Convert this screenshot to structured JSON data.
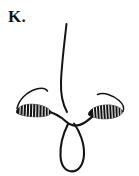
{
  "figure": {
    "plate_label": "K.",
    "domain_type": "diagram",
    "background_color": "#ffffff",
    "ink_color": "#141414",
    "hatch_color": "#ffffff",
    "canvas": {
      "width": 139,
      "height": 176
    },
    "parts": [
      {
        "name": "central-stem",
        "description": "thin slightly curved vertical filament descending from top of plate to the central saddle",
        "stroke_width": 2.0,
        "path": "M 66.5 24 C 64.0 46, 61.5 66, 61.0 82 C 60.6 95, 62.5 104, 67.0 112"
      },
      {
        "name": "central-saddle",
        "description": "rounded connective arch joining left lobe, stem and right lobe",
        "stroke_width": 2.2,
        "path": "M 45.0 110.5 C 54.0 112.5, 60.0 116.0, 66.0 121.5 C 71.5 126.4, 77.5 127.0, 84.0 123.0 C 89.0 120.0, 93.0 116.0, 96.5 113.0"
      },
      {
        "name": "left-lobe",
        "description": "solid black elongated anther lobe with white transverse striations, left side",
        "fill": "#141414",
        "bbox": [
          15,
          104,
          36,
          13
        ],
        "hatch_count": 11,
        "path": "M 16.5 110.5 C 19.5 105.3, 27.0 103.6, 35.0 104.4 C 43.0 105.2, 49.5 108.2, 50.8 111.6 C 51.8 114.4, 47.0 116.6, 38.5 116.8 C 29.0 117.0, 20.0 115.4, 16.5 112.8 Z"
      },
      {
        "name": "left-arc",
        "description": "thin outer arc sweeping up from the left lobe tip toward the stem",
        "stroke_width": 1.5,
        "path": "M 17.0 108.5 C 19.0 99.5, 26.5 92.0, 36.5 89.0 C 42.0 87.4, 45.5 88.2, 47.5 91.0"
      },
      {
        "name": "right-lobe",
        "description": "solid black elongated anther lobe with white transverse striations, right side, tilted",
        "fill": "#141414",
        "bbox": [
          87,
          104,
          36,
          15
        ],
        "hatch_count": 11,
        "path": "M 88.5 113.2 C 90.5 108.6, 97.5 105.6, 105.5 105.0 C 114.0 104.4, 120.8 107.4, 122.3 111.0 C 123.3 113.8, 118.8 117.2, 110.5 118.4 C 101.0 119.8, 92.0 117.4, 88.5 115.0 Z"
      },
      {
        "name": "right-arc",
        "description": "thin outer arc sweeping up and over from the stem side to the right lobe tip",
        "stroke_width": 1.5,
        "path": "M 97.5 94.5 C 104.0 92.0, 112.5 94.8, 119.0 100.5 C 123.0 104.0, 124.5 108.0, 123.0 111.5"
      },
      {
        "name": "pendant-loop",
        "description": "narrow teardrop loop hanging below the saddle, open-ended at top",
        "stroke_width": 2.1,
        "path": "M 68.0 124.0 C 63.0 134.0, 60.0 146.0, 60.5 156.0 C 61.0 166.5, 66.0 171.5, 72.0 171.4 C 78.5 171.3, 83.5 165.0, 84.0 154.5 C 84.5 143.0, 79.5 131.0, 74.0 123.5"
      }
    ]
  }
}
